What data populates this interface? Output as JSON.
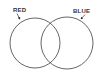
{
  "diagram": {
    "type": "venn",
    "sets": [
      {
        "id": "red",
        "label": "RED",
        "center": [
          35,
          43
        ],
        "radius": 25,
        "label_pos": [
          13,
          12
        ],
        "pointer": [
          [
            17,
            13
          ],
          [
            20,
            19
          ]
        ]
      },
      {
        "id": "blue",
        "label": "BLUE",
        "center": [
          67,
          43
        ],
        "radius": 26,
        "label_pos": [
          73,
          13
        ],
        "pointer": [
          [
            85,
            14
          ],
          [
            81,
            19
          ]
        ]
      }
    ],
    "stroke_color": "#555555",
    "text_color": "#333333",
    "background": "#ffffff"
  }
}
